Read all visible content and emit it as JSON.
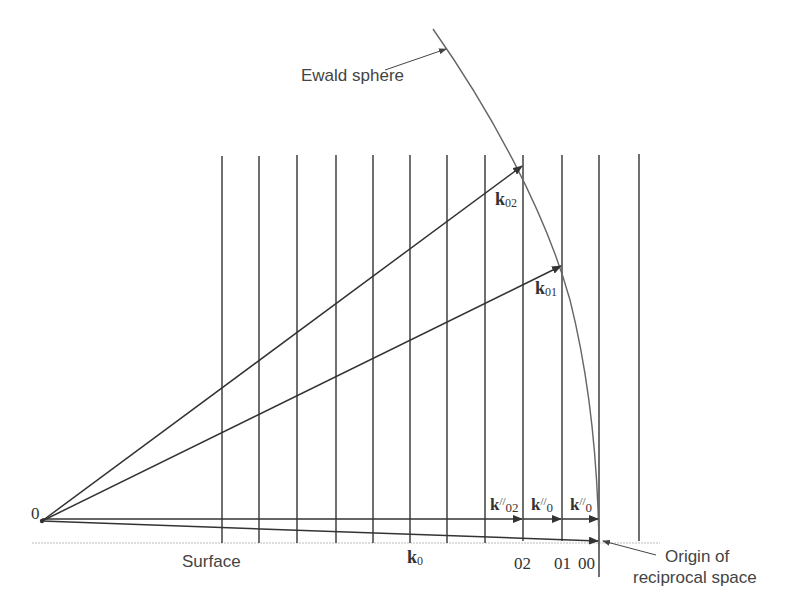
{
  "diagram": {
    "labels": {
      "ewald_sphere": "Ewald sphere",
      "surface": "Surface",
      "origin_point": "0",
      "origin_reciprocal_line1": "Origin of",
      "origin_reciprocal_line2": "reciprocal space"
    },
    "vectors": {
      "k0": {
        "main": "k",
        "sub": "0"
      },
      "k01": {
        "main": "k",
        "sub": "01"
      },
      "k02": {
        "main": "k",
        "sub": "02"
      },
      "k_par_02": {
        "main": "k",
        "sup": "//",
        "sub": "02"
      },
      "k_par_0a": {
        "main": "k",
        "sup": "//",
        "sub": "0"
      },
      "k_par_0b": {
        "main": "k",
        "sup": "//",
        "sub": "0"
      }
    },
    "rod_labels": [
      "02",
      "01",
      "00"
    ],
    "rod_count": 12,
    "colors": {
      "line": "#333333",
      "curve": "#666666",
      "surface": "#bbbbbb",
      "text": "#444444"
    }
  }
}
